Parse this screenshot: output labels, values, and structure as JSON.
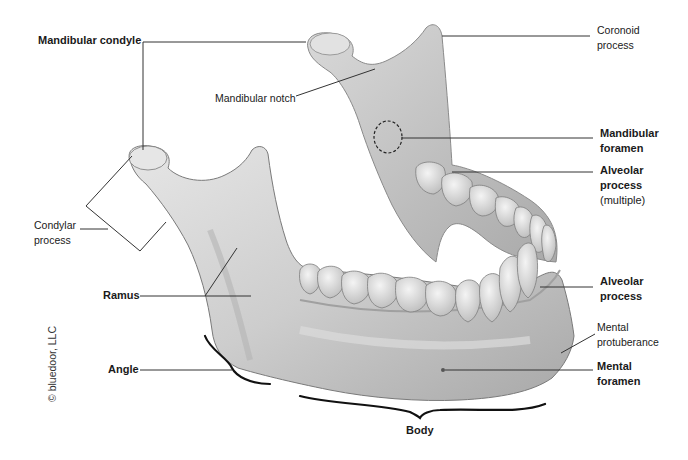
{
  "figure": {
    "copyright": "© bluedoor, LLC"
  },
  "labels": {
    "mandibular_condyle": {
      "lines": [
        "Mandibular condyle"
      ],
      "weight": "bold"
    },
    "coronoid_process": {
      "lines": [
        "Coronoid",
        "process"
      ],
      "weight": "regular"
    },
    "mandibular_notch": {
      "lines": [
        "Mandibular notch"
      ],
      "weight": "regular"
    },
    "mandibular_foramen": {
      "lines": [
        "Mandibular",
        "foramen"
      ],
      "weight": "bold"
    },
    "alveolar_process_multiple": {
      "lines": [
        "Alveolar",
        "process"
      ],
      "note": "(multiple)",
      "weight": "bold"
    },
    "condylar_process": {
      "lines": [
        "Condylar",
        "process"
      ],
      "weight": "regular"
    },
    "ramus": {
      "lines": [
        "Ramus"
      ],
      "weight": "bold"
    },
    "alveolar_process": {
      "lines": [
        "Alveolar",
        "process"
      ],
      "weight": "bold"
    },
    "mental_protuberance": {
      "lines": [
        "Mental",
        "protuberance"
      ],
      "weight": "regular"
    },
    "mental_foramen": {
      "lines": [
        "Mental",
        "foramen"
      ],
      "weight": "bold"
    },
    "angle": {
      "lines": [
        "Angle"
      ],
      "weight": "bold"
    },
    "body": {
      "lines": [
        "Body"
      ],
      "weight": "bold"
    }
  },
  "colors": {
    "bone_light": "#e4e4e4",
    "bone_mid": "#c9c9c9",
    "bone_shadow": "#9a9a9a",
    "tooth": "#ececec",
    "leader_line": "#333333",
    "brace": "#111111"
  }
}
